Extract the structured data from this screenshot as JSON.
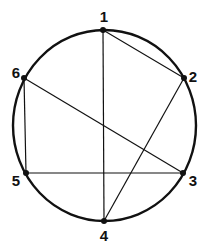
{
  "diagram": {
    "type": "circle-graph",
    "colors": {
      "stroke": "#111111",
      "background": "#ffffff"
    },
    "circle": {
      "cx": 104.5,
      "cy": 125.5,
      "rx": 91.5,
      "ry": 95.5
    },
    "points": [
      {
        "id": "1",
        "label": "1",
        "x": 103,
        "y": 30,
        "lx": 104,
        "ly": 22
      },
      {
        "id": "2",
        "label": "2",
        "x": 184,
        "y": 78,
        "lx": 193,
        "ly": 82
      },
      {
        "id": "3",
        "label": "3",
        "x": 183,
        "y": 173,
        "lx": 193,
        "ly": 186
      },
      {
        "id": "4",
        "label": "4",
        "x": 104,
        "y": 221,
        "lx": 104,
        "ly": 241
      },
      {
        "id": "5",
        "label": "5",
        "x": 26,
        "y": 173,
        "lx": 16,
        "ly": 186
      },
      {
        "id": "6",
        "label": "6",
        "x": 24,
        "y": 78,
        "lx": 16,
        "ly": 78
      }
    ],
    "edges": [
      [
        "1",
        "4"
      ],
      [
        "1",
        "2"
      ],
      [
        "2",
        "4"
      ],
      [
        "6",
        "3"
      ],
      [
        "6",
        "5"
      ],
      [
        "5",
        "3"
      ]
    ]
  }
}
